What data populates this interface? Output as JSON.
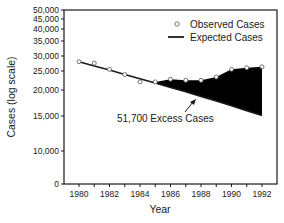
{
  "chart_data": {
    "type": "line",
    "title": "",
    "xlabel": "Year",
    "ylabel": "Cases (log scale)",
    "y_scale": "log",
    "xlim": [
      1979,
      1993
    ],
    "ylim": [
      0,
      50000
    ],
    "grid": false,
    "legend_position": "top-right",
    "x_ticks": [
      "1980",
      "1982",
      "1984",
      "1986",
      "1988",
      "1990",
      "1992"
    ],
    "y_ticks": [
      "50,000",
      "45,000",
      "40,000",
      "35,000",
      "30,000",
      "25,000",
      "20,000",
      "15,000",
      "10,000",
      "0"
    ],
    "x": [
      1980,
      1981,
      1982,
      1983,
      1984,
      1985,
      1986,
      1987,
      1988,
      1989,
      1990,
      1991,
      1992
    ],
    "series": [
      {
        "name": "Observed Cases",
        "style": "open-circle-markers",
        "values": [
          28000,
          27500,
          25500,
          24000,
          22000,
          22000,
          22700,
          22400,
          22400,
          23300,
          25500,
          26000,
          26300
        ]
      },
      {
        "name": "Expected Cases",
        "style": "solid-line",
        "values": [
          28000,
          26600,
          25300,
          24000,
          22800,
          21700,
          20600,
          19600,
          18600,
          17700,
          16800,
          15900,
          15100
        ]
      }
    ],
    "shaded_region": {
      "label": "51,700 Excess Cases",
      "between": [
        "Observed Cases",
        "Expected Cases"
      ],
      "x_range": [
        1985,
        1992
      ],
      "color": "#000000"
    },
    "annotations": [
      {
        "text": "51,700 Excess Cases",
        "arrow_to": "shaded-region",
        "x": 1987.5,
        "y": 15000
      }
    ]
  },
  "labels": {
    "legend_observed": "Observed Cases",
    "legend_expected": "Expected Cases",
    "annotation": "51,700 Excess Cases",
    "xlabel": "Year",
    "ylabel": "Cases (log scale)"
  }
}
